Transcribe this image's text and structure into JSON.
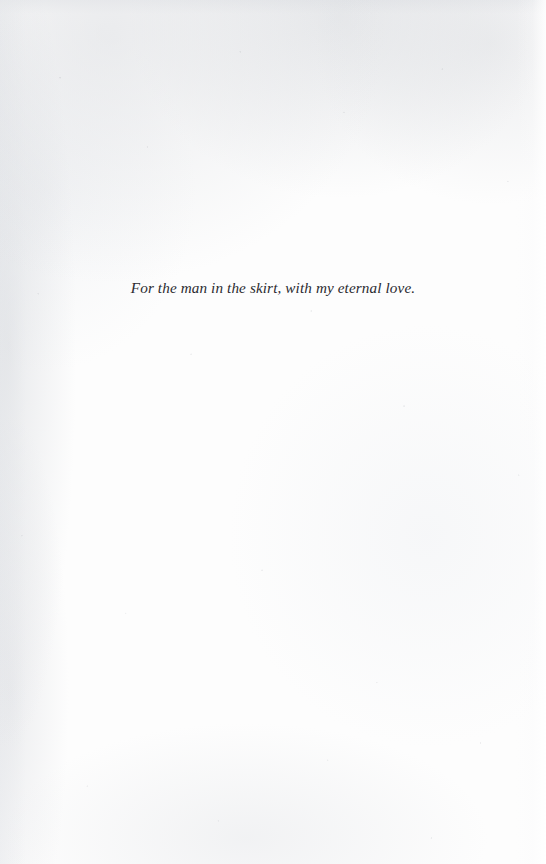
{
  "page": {
    "kind": "book-dedication-page",
    "width": 546,
    "height": 864,
    "background_color": "#fdfdfd",
    "text_color": "#2b2b30"
  },
  "dedication": {
    "text": "For the man in the skirt, with my eternal love."
  }
}
